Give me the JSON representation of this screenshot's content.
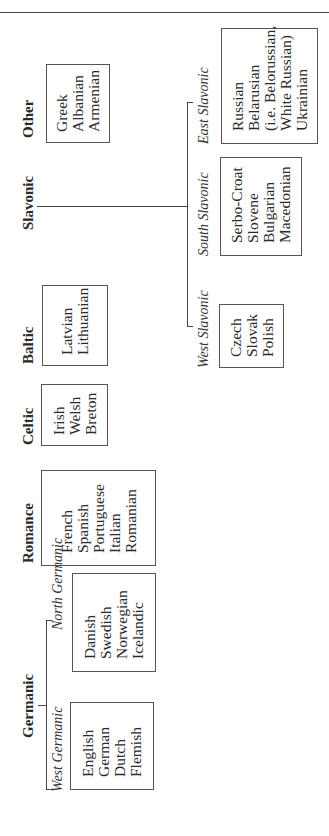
{
  "diagram": {
    "title": "",
    "groups": [
      {
        "name": "Germanic",
        "subgroups": [
          {
            "name": "West Germanic",
            "languages": [
              "English",
              "German",
              "Dutch",
              "Flemish"
            ]
          },
          {
            "name": "North Germanic",
            "languages": [
              "Danish",
              "Swedish",
              "Norwegian",
              "Icelandic"
            ]
          }
        ]
      },
      {
        "name": "Romance",
        "languages": [
          "French",
          "Spanish",
          "Portuguese",
          "Italian",
          "Romanian"
        ]
      },
      {
        "name": "Celtic",
        "languages": [
          "Irish",
          "Welsh",
          "Breton"
        ]
      },
      {
        "name": "Baltic",
        "languages": [
          "Latvian",
          "Lithuanian"
        ]
      },
      {
        "name": "Slavonic",
        "subgroups": [
          {
            "name": "West Slavonic",
            "languages": [
              "Czech",
              "Slovak",
              "Polish"
            ]
          },
          {
            "name": "South Slavonic",
            "languages": [
              "Serbo-Croat",
              "Slovene",
              "Bulgarian",
              "Macedonian"
            ]
          },
          {
            "name": "East Slavonic",
            "languages": [
              "Russian",
              "Belarusian",
              "(i.e. Belorussian,",
              "White Russian)",
              "Ukrainian"
            ]
          }
        ]
      },
      {
        "name": "Other",
        "languages": [
          "Greek",
          "Albanian",
          "Armenian"
        ]
      }
    ]
  }
}
